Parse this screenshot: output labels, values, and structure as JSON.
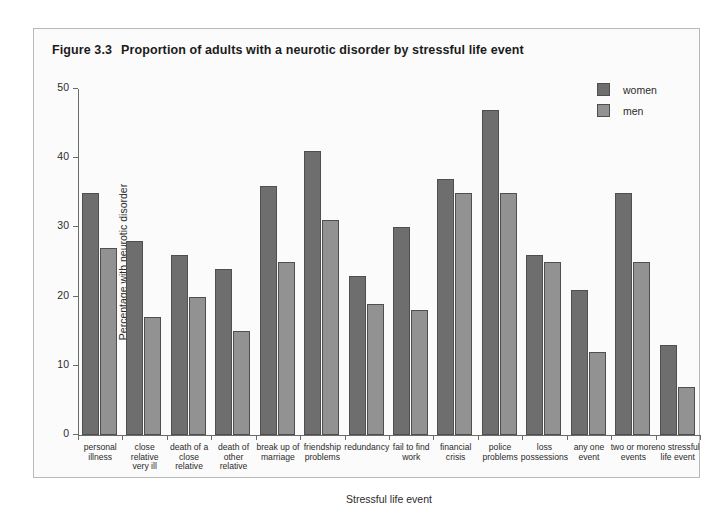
{
  "figure": {
    "number": "Figure 3.3",
    "title": "Proportion of adults with a neurotic disorder by stressful life event"
  },
  "legend": {
    "position": "top-right",
    "entries": [
      {
        "label": "women",
        "color": "#6e6e6e"
      },
      {
        "label": "men",
        "color": "#929292"
      }
    ]
  },
  "axis": {
    "y": {
      "title": "Percentage with neurotic disorder",
      "ticks": [
        "0",
        "10",
        "20",
        "30",
        "40",
        "50"
      ]
    },
    "x": {
      "title": "Stressful life event"
    }
  },
  "chart_data": {
    "type": "bar",
    "xlabel": "Stressful life event",
    "ylabel": "Percentage with neurotic disorder",
    "ylim": [
      0,
      50
    ],
    "yticks": [
      0,
      10,
      20,
      30,
      40,
      50
    ],
    "grid": false,
    "legend_position": "top-right",
    "categories": [
      "personal illness",
      "close relative very ill",
      "death of a close relative",
      "death of other relative",
      "break up of marriage",
      "friendship problems",
      "redundancy",
      "fail to find work",
      "financial crisis",
      "police problems",
      "loss possessions",
      "any one event",
      "two or more events",
      "no stressful life event"
    ],
    "category_lines": [
      [
        "personal",
        "illness"
      ],
      [
        "close",
        "relative",
        "very ill"
      ],
      [
        "death of a",
        "close",
        "relative"
      ],
      [
        "death of",
        "other",
        "relative"
      ],
      [
        "break up of",
        "marriage"
      ],
      [
        "friendship",
        "problems"
      ],
      [
        "redundancy"
      ],
      [
        "fail to find",
        "work"
      ],
      [
        "financial",
        "crisis"
      ],
      [
        "police",
        "problems"
      ],
      [
        "loss",
        "possessions"
      ],
      [
        "any one",
        "event"
      ],
      [
        "two or more",
        "events"
      ],
      [
        "no stressful",
        "life event"
      ]
    ],
    "series": [
      {
        "name": "women",
        "color": "#6e6e6e",
        "values": [
          35,
          28,
          26,
          24,
          36,
          41,
          23,
          30,
          37,
          47,
          26,
          21,
          35,
          13
        ]
      },
      {
        "name": "men",
        "color": "#929292",
        "values": [
          27,
          17,
          20,
          15,
          25,
          31,
          19,
          18,
          35,
          35,
          25,
          12,
          25,
          7
        ]
      }
    ]
  }
}
